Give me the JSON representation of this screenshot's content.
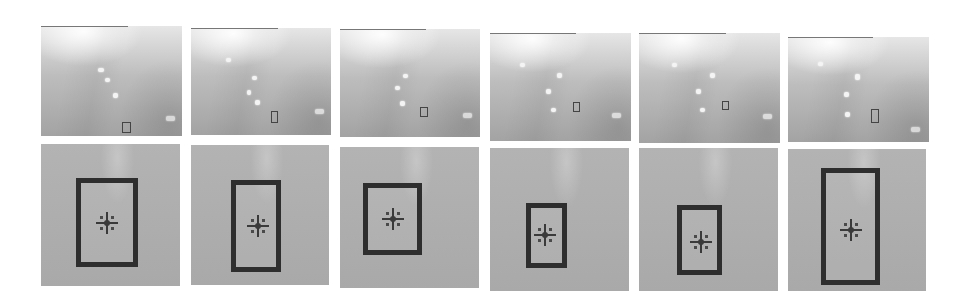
{
  "figure": {
    "layout": {
      "rows": 2,
      "columns": 6
    },
    "colors": {
      "background": "#ffffff",
      "scene_light": "#e6e6e6",
      "scene_dark": "#a3a3a3",
      "crop_gray": "#afafaf",
      "bbox": "#2e2e2e",
      "marker": "#3a3a3a"
    },
    "frames": [
      {
        "index": 1,
        "scene": {
          "x": 41,
          "y": 26,
          "w": 141,
          "h": 110,
          "line_w": 87,
          "box": {
            "x": 81,
            "y": 96,
            "w": 7,
            "h": 9
          },
          "blobs": [
            [
              57,
              42,
              6,
              4
            ],
            [
              64,
              52,
              5,
              4
            ],
            [
              72,
              67,
              5,
              5
            ],
            [
              125,
              90,
              9,
              5
            ]
          ]
        },
        "crop": {
          "x": 41,
          "y": 144,
          "w": 139,
          "h": 142,
          "bbox": {
            "x": 35,
            "y": 34,
            "w": 62,
            "h": 89
          },
          "marker": {
            "x": 66,
            "y": 79
          }
        }
      },
      {
        "index": 2,
        "scene": {
          "x": 191,
          "y": 28,
          "w": 140,
          "h": 107,
          "line_w": 87,
          "box": {
            "x": 80,
            "y": 83,
            "w": 5,
            "h": 10
          },
          "blobs": [
            [
              35,
              30,
              5,
              4
            ],
            [
              61,
              48,
              5,
              4
            ],
            [
              56,
              62,
              4,
              5
            ],
            [
              64,
              72,
              5,
              5
            ],
            [
              124,
              81,
              9,
              5
            ]
          ]
        },
        "crop": {
          "x": 191,
          "y": 145,
          "w": 138,
          "h": 140,
          "bbox": {
            "x": 40,
            "y": 35,
            "w": 50,
            "h": 92
          },
          "marker": {
            "x": 67,
            "y": 81
          }
        }
      },
      {
        "index": 3,
        "scene": {
          "x": 340,
          "y": 29,
          "w": 140,
          "h": 108,
          "line_w": 86,
          "box": {
            "x": 80,
            "y": 78,
            "w": 6,
            "h": 8
          },
          "blobs": [
            [
              63,
              45,
              5,
              4
            ],
            [
              55,
              57,
              5,
              4
            ],
            [
              60,
              72,
              5,
              5
            ],
            [
              123,
              84,
              9,
              5
            ]
          ]
        },
        "crop": {
          "x": 340,
          "y": 147,
          "w": 139,
          "h": 141,
          "bbox": {
            "x": 23,
            "y": 36,
            "w": 59,
            "h": 72
          },
          "marker": {
            "x": 53,
            "y": 72
          }
        }
      },
      {
        "index": 4,
        "scene": {
          "x": 490,
          "y": 33,
          "w": 141,
          "h": 108,
          "line_w": 86,
          "box": {
            "x": 83,
            "y": 69,
            "w": 5,
            "h": 8
          },
          "blobs": [
            [
              30,
              30,
              5,
              4
            ],
            [
              67,
              40,
              5,
              5
            ],
            [
              56,
              56,
              5,
              5
            ],
            [
              61,
              75,
              5,
              4
            ],
            [
              122,
              80,
              9,
              5
            ]
          ]
        },
        "crop": {
          "x": 490,
          "y": 148,
          "w": 139,
          "h": 143,
          "bbox": {
            "x": 36,
            "y": 55,
            "w": 41,
            "h": 65
          },
          "marker": {
            "x": 55,
            "y": 87
          }
        }
      },
      {
        "index": 5,
        "scene": {
          "x": 639,
          "y": 33,
          "w": 141,
          "h": 110,
          "line_w": 87,
          "box": {
            "x": 83,
            "y": 68,
            "w": 5,
            "h": 7
          },
          "blobs": [
            [
              33,
              30,
              5,
              4
            ],
            [
              71,
              40,
              5,
              5
            ],
            [
              57,
              56,
              5,
              5
            ],
            [
              61,
              75,
              5,
              4
            ],
            [
              124,
              81,
              9,
              5
            ]
          ]
        },
        "crop": {
          "x": 639,
          "y": 148,
          "w": 139,
          "h": 143,
          "bbox": {
            "x": 38,
            "y": 57,
            "w": 45,
            "h": 70
          },
          "marker": {
            "x": 62,
            "y": 94
          }
        }
      },
      {
        "index": 6,
        "scene": {
          "x": 788,
          "y": 37,
          "w": 141,
          "h": 105,
          "line_w": 85,
          "box": {
            "x": 83,
            "y": 72,
            "w": 6,
            "h": 12
          },
          "blobs": [
            [
              30,
              25,
              5,
              4
            ],
            [
              67,
              37,
              5,
              6
            ],
            [
              56,
              55,
              5,
              5
            ],
            [
              57,
              75,
              5,
              5
            ],
            [
              123,
              90,
              9,
              5
            ]
          ]
        },
        "crop": {
          "x": 788,
          "y": 149,
          "w": 138,
          "h": 142,
          "bbox": {
            "x": 33,
            "y": 19,
            "w": 59,
            "h": 117
          },
          "marker": {
            "x": 63,
            "y": 81
          }
        }
      }
    ]
  }
}
